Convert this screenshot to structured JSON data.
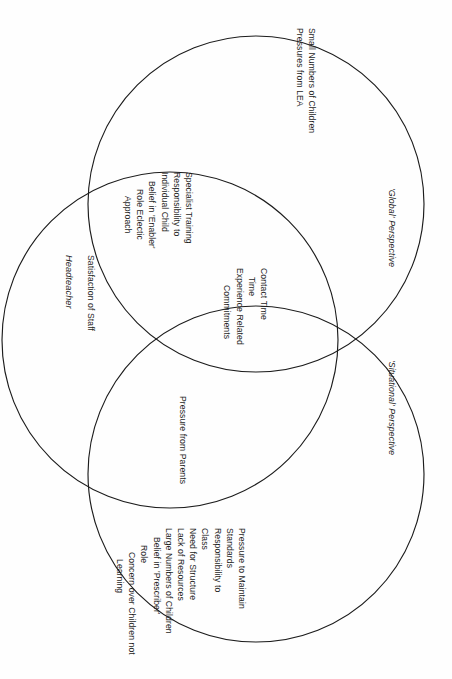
{
  "diagram": {
    "type": "venn-three-circle",
    "orientation": "page rotated 90 degrees clockwise; all text reads bottom-to-top",
    "circles": [
      {
        "id": "headteacher",
        "label": "Headteacher"
      },
      {
        "id": "global",
        "label": "'Global' Perspective"
      },
      {
        "id": "situational",
        "label": "'Situational' Perspective"
      }
    ]
  },
  "labels": {
    "headteacher_title": "Headteacher",
    "global_perspective": "'Global' Perspective",
    "situational_perspective": "'Situational' Perspective"
  },
  "regions": {
    "headteacher_only": {
      "name": "Headteacher only",
      "lines": [
        "Satisfaction of Staff"
      ]
    },
    "global_only": {
      "name": "Global perspective only",
      "lines": [
        "Small Numbers of Children",
        "Pressures from LEA"
      ]
    },
    "headteacher_global": {
      "name": "Headteacher and Global overlap",
      "lines": [
        "Specialist Training",
        "Responsibility to",
        "Individual Child",
        "Belief in 'Enabler'",
        "Role  Eclectic",
        "Approach"
      ]
    },
    "center_all_three": {
      "name": "Centre of all three circles",
      "lines": [
        "Contact Time",
        "Time",
        "Experience Related",
        "Commitments"
      ]
    },
    "headteacher_situational": {
      "name": "Headteacher and Situational overlap",
      "lines": [
        "Pressure from Parents"
      ]
    },
    "situational_only": {
      "name": "Situational perspective only",
      "lines": [
        "Pressure to Maintain",
        "Standards",
        "Responsibility to",
        "Class",
        "Need for Structure",
        "Lack of Resources",
        "Large Numbers of Children",
        "Belief in 'Prescriber'",
        "Role",
        "Concern over Children not",
        "Learning"
      ]
    }
  },
  "colors": {
    "stroke": "#1c1c1c",
    "background": "#fefefe",
    "text": "#1e1e1e"
  }
}
